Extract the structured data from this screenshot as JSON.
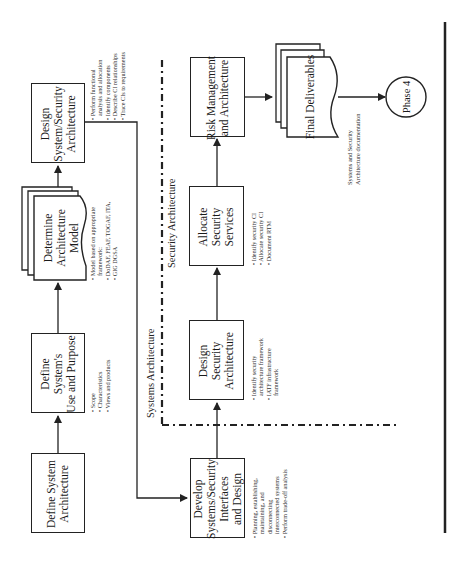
{
  "diagram": {
    "orientation": "rotated-90-ccw",
    "colors": {
      "line": "#222222",
      "background": "#ffffff",
      "text": "#1a1a1a"
    },
    "regions": {
      "systems_label": "Systems Architecture",
      "security_label": "Security Architecture"
    },
    "steps": {
      "define_arch": {
        "label": "Define System Architecture"
      },
      "define_use": {
        "label": "Define System's Use and Purpose",
        "notes": [
          "• Scope",
          "• Characteristics",
          "• Views and products"
        ]
      },
      "determine_model": {
        "label": "Determine Architecture Model",
        "notes": [
          "• Model based on appropriate",
          "  framework:",
          "• DoDAF, FEAF, TOGAF, ITA,",
          "• GIG DGSA"
        ]
      },
      "design_sys_sec": {
        "label": "Design System/Security Architecture",
        "notes": [
          "• Perform functional",
          "  analysis and allocation",
          "• Identify components",
          "• Describe CI relationships",
          "• Trace CIs to requirements"
        ]
      },
      "develop_interfaces": {
        "label": "Develop Systems/Security Interfaces and Design",
        "notes": [
          "• Planning, establishing,",
          "  maintaining, and",
          "  disconnecting",
          "  interconnected systems",
          "• Perform trade-off analysis"
        ]
      },
      "design_sec_arch": {
        "label": "Design Security Architecture",
        "notes": [
          "• Identify security",
          "  architecture framework",
          "• IATF infrastructure",
          "  framework"
        ]
      },
      "allocate_services": {
        "label": "Allocate Security Services",
        "notes": [
          "• Identify security CI",
          "• Allocate security CI",
          "• Document RTM"
        ]
      },
      "risk_mgmt": {
        "label": "Risk Management and Architecture"
      },
      "final_deliverables": {
        "label": "Final Deliverables",
        "caption": [
          "Systems and Security",
          "Architecture documentation"
        ]
      },
      "phase4": {
        "label": "Phase 4"
      }
    }
  }
}
